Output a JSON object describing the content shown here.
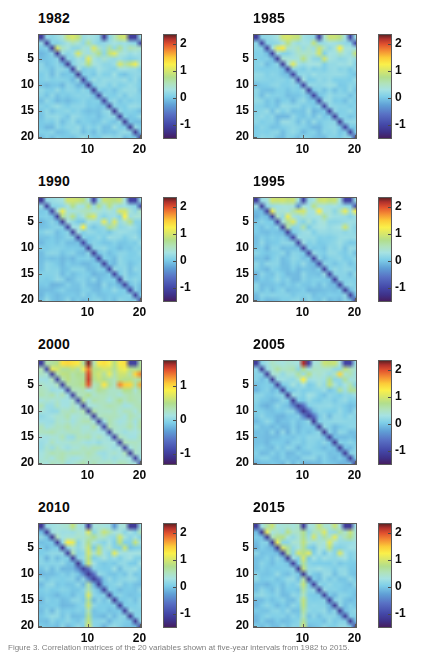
{
  "figure": {
    "layout": {
      "rows": 4,
      "cols": 2,
      "panel_count": 8
    },
    "caption_fragment": "Figure 3. Correlation matrices of the 20 variables shown at five-year intervals from 1982 to 2015."
  },
  "chart_data": [
    {
      "type": "heatmap",
      "title": "1982",
      "xlabel": "",
      "ylabel": "",
      "xticks": [
        10,
        20
      ],
      "yticks": [
        5,
        10,
        15,
        20
      ],
      "xlim": [
        0.5,
        20.5
      ],
      "ylim": [
        0.5,
        20.5
      ],
      "grid": false,
      "nrows": 20,
      "ncols": 20,
      "colormap": "jet",
      "colorbar": {
        "ticks": [
          -1,
          0,
          1,
          2
        ],
        "tick_labels": [
          "-1",
          "0",
          "1",
          "2"
        ],
        "vmin": -1.55,
        "vmax": 2.35,
        "position": "right"
      },
      "features": {
        "diagonal_value": -1.2,
        "background_value": 0.02,
        "top_rows_elevated": true,
        "notes": "Upper-left rows 1-2 show yellow highs (~1.0) and isolated dark blue cells (~-1.2) near columns 13 and 18-19."
      },
      "matrix_summary": {
        "row1": [
          -1.2,
          0.15,
          0.1,
          0.2,
          0.35,
          0.9,
          1.0,
          0.85,
          0.2,
          0.3,
          0.25,
          0.15,
          -1.2,
          0.1,
          0.45,
          0.9,
          0.95,
          -1.15,
          -1.15,
          0.2
        ],
        "row2": [
          0.15,
          -1.2,
          0.1,
          0.05,
          0.15,
          0.3,
          0.5,
          0.35,
          0.15,
          0.65,
          0.2,
          0.1,
          0.15,
          0.2,
          0.3,
          0.2,
          0.25,
          0.15,
          0.1,
          -1.1
        ],
        "mid_rows_value": 0.03,
        "lower_triangle_value": 0.02
      }
    },
    {
      "type": "heatmap",
      "title": "1985",
      "xlabel": "",
      "ylabel": "",
      "xticks": [
        10,
        20
      ],
      "yticks": [
        5,
        10,
        15,
        20
      ],
      "xlim": [
        0.5,
        20.5
      ],
      "ylim": [
        0.5,
        20.5
      ],
      "grid": false,
      "nrows": 20,
      "ncols": 20,
      "colormap": "jet",
      "colorbar": {
        "ticks": [
          -1,
          0,
          1,
          2
        ],
        "tick_labels": [
          "-1",
          "0",
          "1",
          "2"
        ],
        "vmin": -1.55,
        "vmax": 2.35,
        "position": "right"
      },
      "features": {
        "diagonal_value": -1.15,
        "background_value": 0.02,
        "top_rows_elevated": true,
        "notes": "Row 1 has yellow band at columns 6-9 plus dark blue at column 13 and near column 19."
      },
      "matrix_summary": {
        "row1": [
          -1.15,
          0.1,
          0.15,
          0.2,
          0.3,
          0.95,
          1.0,
          0.9,
          0.85,
          0.25,
          0.2,
          0.15,
          -1.15,
          0.35,
          0.9,
          0.9,
          0.8,
          0.25,
          -1.1,
          0.2
        ],
        "row2": [
          0.1,
          -1.15,
          0.1,
          0.1,
          0.15,
          0.3,
          0.8,
          0.35,
          0.2,
          0.3,
          0.25,
          0.85,
          0.15,
          0.2,
          0.3,
          0.25,
          0.2,
          0.15,
          0.1,
          -1.05
        ],
        "mid_rows_value": 0.03,
        "lower_triangle_value": 0.02
      }
    },
    {
      "type": "heatmap",
      "title": "1990",
      "xlabel": "",
      "ylabel": "",
      "xticks": [
        10,
        20
      ],
      "yticks": [
        5,
        10,
        15,
        20
      ],
      "xlim": [
        0.5,
        20.5
      ],
      "ylim": [
        0.5,
        20.5
      ],
      "grid": false,
      "nrows": 20,
      "ncols": 20,
      "colormap": "jet",
      "colorbar": {
        "ticks": [
          -1,
          0,
          1,
          2
        ],
        "tick_labels": [
          "-1",
          "0",
          "1",
          "2"
        ],
        "vmin": -1.55,
        "vmax": 2.35,
        "position": "right"
      },
      "features": {
        "diagonal_value": -1.15,
        "background_value": 0.0,
        "top_rows_elevated": true,
        "notes": "Row 1 shows a broad yellow run over columns 6-9 and 13-18, with dark blue at column 11 and columns 18-19."
      },
      "matrix_summary": {
        "row1": [
          -1.15,
          0.15,
          0.2,
          0.25,
          0.3,
          0.95,
          0.95,
          0.9,
          0.8,
          0.3,
          -1.1,
          0.2,
          0.9,
          0.85,
          0.8,
          0.9,
          0.3,
          -1.1,
          -1.1,
          0.15
        ],
        "row2": [
          0.15,
          -1.15,
          0.1,
          0.1,
          0.15,
          0.3,
          0.75,
          0.3,
          0.25,
          0.8,
          0.2,
          0.75,
          0.25,
          0.8,
          0.35,
          0.2,
          0.25,
          0.15,
          0.1,
          -1.0
        ],
        "mid_rows_value": 0.0,
        "lower_triangle_value": 0.0
      }
    },
    {
      "type": "heatmap",
      "title": "1995",
      "xlabel": "",
      "ylabel": "",
      "xticks": [
        10,
        20
      ],
      "yticks": [
        5,
        10,
        15,
        20
      ],
      "xlim": [
        0.5,
        20.5
      ],
      "ylim": [
        0.5,
        20.5
      ],
      "grid": false,
      "nrows": 20,
      "ncols": 20,
      "colormap": "jet",
      "colorbar": {
        "ticks": [
          -1,
          0,
          1,
          2
        ],
        "tick_labels": [
          "-1",
          "0",
          "1",
          "2"
        ],
        "vmin": -1.55,
        "vmax": 2.35,
        "position": "right"
      },
      "features": {
        "diagonal_value": -1.15,
        "background_value": 0.0,
        "top_rows_elevated": true,
        "notes": "Row 1 yellow at columns 4-8 and 13-18; dark blue cells at column 10 and columns 18-19. Faint yellow patch near rows 14-16, columns 8-10."
      },
      "matrix_summary": {
        "row1": [
          -1.15,
          0.2,
          0.3,
          0.95,
          0.9,
          0.95,
          0.85,
          0.9,
          0.25,
          -1.1,
          0.2,
          0.3,
          0.9,
          0.95,
          0.85,
          0.9,
          0.3,
          -1.1,
          -1.1,
          0.2
        ],
        "row2": [
          0.2,
          -1.15,
          0.15,
          0.2,
          0.25,
          0.3,
          0.35,
          0.3,
          -0.45,
          0.3,
          0.25,
          0.8,
          0.3,
          0.35,
          0.25,
          0.3,
          0.2,
          0.15,
          0.1,
          -1.0
        ],
        "mid_rows_value": 0.0,
        "lower_triangle_value": 0.0
      }
    },
    {
      "type": "heatmap",
      "title": "2000",
      "xlabel": "",
      "ylabel": "",
      "xticks": [
        10,
        20
      ],
      "yticks": [
        5,
        10,
        15,
        20
      ],
      "xlim": [
        0.5,
        20.5
      ],
      "ylim": [
        0.5,
        20.5
      ],
      "grid": false,
      "nrows": 20,
      "ncols": 20,
      "colormap": "jet",
      "colorbar": {
        "ticks": [
          -1,
          0,
          1
        ],
        "tick_labels": [
          "-1",
          "0",
          "1"
        ],
        "vmin": -1.35,
        "vmax": 1.75,
        "position": "right"
      },
      "features": {
        "diagonal_value": -1.0,
        "background_value": 0.18,
        "top_rows_elevated": true,
        "notes": "Strong dark-red vertical run at column 10 for rows 1-5 (values near 1.7). Row 1 yellow over columns 5-9 and 12-18, with dark blue at columns 11 and 18-19. Yellow streak down column 10 through rows 12-20."
      },
      "matrix_summary": {
        "row1": [
          -1.0,
          0.35,
          0.4,
          0.5,
          0.95,
          1.0,
          0.95,
          0.9,
          0.4,
          1.7,
          0.3,
          0.9,
          0.95,
          0.85,
          0.5,
          0.9,
          0.95,
          -1.0,
          -1.0,
          0.4
        ],
        "col10_rows2to5": [
          1.35,
          1.5,
          1.55,
          1.45
        ],
        "mid_rows_value": 0.18,
        "lower_triangle_value": 0.16
      }
    },
    {
      "type": "heatmap",
      "title": "2005",
      "xlabel": "",
      "ylabel": "",
      "xticks": [
        10,
        20
      ],
      "yticks": [
        5,
        10,
        15,
        20
      ],
      "xlim": [
        0.5,
        20.5
      ],
      "ylim": [
        0.5,
        20.5
      ],
      "grid": false,
      "nrows": 20,
      "ncols": 20,
      "colormap": "jet",
      "colorbar": {
        "ticks": [
          -1,
          0,
          1,
          2
        ],
        "tick_labels": [
          "-1",
          "0",
          "1",
          "2"
        ],
        "vmin": -1.55,
        "vmax": 2.35,
        "position": "right"
      },
      "features": {
        "diagonal_value": -1.2,
        "background_value": -0.02,
        "top_rows_elevated": true,
        "notes": "Dark red cell at row 1 column 10 (~2.2) with an orange cell at row 4 column 10. Row 1 yellow at columns 14-18, dark blue at column 11 and columns 18-19. Blue segment on the diagonal near rows 9-11."
      },
      "matrix_summary": {
        "row1": [
          -1.2,
          0.1,
          0.25,
          0.45,
          0.35,
          0.3,
          0.4,
          0.35,
          0.3,
          2.2,
          -1.1,
          0.3,
          0.4,
          0.9,
          0.85,
          0.9,
          0.3,
          -1.1,
          -1.1,
          0.2
        ],
        "col10_rows2to5": [
          0.75,
          0.2,
          1.25,
          0.3
        ],
        "mid_rows_value": -0.02,
        "lower_triangle_value": -0.03
      }
    },
    {
      "type": "heatmap",
      "title": "2010",
      "xlabel": "",
      "ylabel": "",
      "xticks": [
        10,
        20
      ],
      "yticks": [
        5,
        10,
        15,
        20
      ],
      "xlim": [
        0.5,
        20.5
      ],
      "ylim": [
        0.5,
        20.5
      ],
      "grid": false,
      "nrows": 20,
      "ncols": 20,
      "colormap": "jet",
      "colorbar": {
        "ticks": [
          -1,
          0,
          1,
          2
        ],
        "tick_labels": [
          "-1",
          "0",
          "1",
          "2"
        ],
        "vmin": -1.55,
        "vmax": 2.35,
        "position": "right"
      },
      "features": {
        "diagonal_value": -1.2,
        "background_value": 0.0,
        "top_rows_elevated": true,
        "notes": "Dark blue block at row 1 column 10 and rows 1-2 columns 18-19. Yellow vertical streak down column 10 for rows 2-20, with a bright yellow cell at row 20 column 10. Blue segment on diagonal near rows 9-11."
      },
      "matrix_summary": {
        "row1": [
          -1.2,
          0.2,
          0.25,
          0.3,
          0.35,
          0.4,
          0.85,
          0.3,
          0.25,
          -1.2,
          0.3,
          0.35,
          0.3,
          0.25,
          -0.35,
          0.3,
          0.35,
          -1.2,
          -1.2,
          0.2
        ],
        "col10_streak_value": 0.9,
        "mid_rows_value": 0.0,
        "lower_triangle_value": 0.0
      }
    },
    {
      "type": "heatmap",
      "title": "2015",
      "xlabel": "",
      "ylabel": "",
      "xticks": [
        10,
        20
      ],
      "yticks": [
        5,
        10,
        15,
        20
      ],
      "xlim": [
        0.5,
        20.5
      ],
      "ylim": [
        0.5,
        20.5
      ],
      "grid": false,
      "nrows": 20,
      "ncols": 20,
      "colormap": "jet",
      "colorbar": {
        "ticks": [
          -1,
          0,
          1,
          2
        ],
        "tick_labels": [
          "-1",
          "0",
          "1",
          "2"
        ],
        "vmin": -1.55,
        "vmax": 2.35,
        "position": "right"
      },
      "features": {
        "diagonal_value": -1.2,
        "background_value": 0.0,
        "top_rows_elevated": true,
        "notes": "Dark blue block at row 1 column 10 and rows 1-2 columns 18-19. Yellow cells scattered near columns 9-13 rows 12-17, plus a yellow streak down column 10 toward rows 16-18."
      },
      "matrix_summary": {
        "row1": [
          -1.2,
          0.25,
          0.6,
          0.9,
          0.3,
          0.35,
          0.4,
          0.3,
          0.45,
          -1.2,
          0.3,
          0.35,
          0.9,
          0.4,
          0.35,
          0.9,
          0.3,
          -1.2,
          -1.2,
          0.25
        ],
        "col10_streak_value": 0.85,
        "mid_rows_value": 0.0,
        "lower_triangle_value": 0.0
      }
    }
  ]
}
